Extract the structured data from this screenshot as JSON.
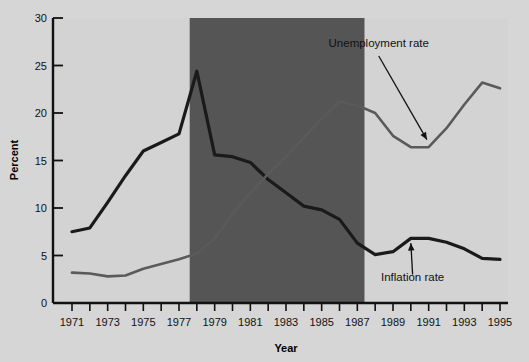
{
  "chart_data": {
    "type": "line",
    "title": "",
    "xlabel": "Year",
    "ylabel": "Percent",
    "xlim": [
      1971,
      1995
    ],
    "ylim": [
      0,
      30
    ],
    "yticks": [
      0,
      5,
      10,
      15,
      20,
      25,
      30
    ],
    "xticks": [
      1971,
      1972,
      1973,
      1974,
      1975,
      1976,
      1977,
      1978,
      1979,
      1980,
      1981,
      1982,
      1983,
      1984,
      1985,
      1986,
      1987,
      1988,
      1989,
      1990,
      1991,
      1992,
      1993,
      1994,
      1995
    ],
    "xtick_labels_shown": [
      "1971",
      "1973",
      "1975",
      "1977",
      "1979",
      "1981",
      "1983",
      "1985",
      "1987",
      "1989",
      "1991",
      "1993",
      "1995"
    ],
    "ytick_labels": [
      "0",
      "5",
      "10",
      "15",
      "20",
      "25",
      "30"
    ],
    "grid": false,
    "legend_position": "inline-annotations",
    "x": [
      1971,
      1972,
      1973,
      1974,
      1975,
      1976,
      1977,
      1978,
      1979,
      1980,
      1981,
      1982,
      1983,
      1984,
      1985,
      1986,
      1987,
      1988,
      1989,
      1990,
      1991,
      1992,
      1993,
      1994,
      1995
    ],
    "series": [
      {
        "name": "Inflation rate",
        "color": "#1a1a1a",
        "line_width": 3.2,
        "values": [
          7.5,
          7.9,
          10.6,
          13.4,
          16.0,
          16.9,
          17.8,
          24.4,
          15.6,
          15.4,
          14.8,
          13.0,
          11.6,
          10.2,
          9.8,
          8.8,
          6.3,
          5.1,
          5.4,
          6.8,
          6.8,
          6.4,
          5.7,
          4.7,
          4.6
        ]
      },
      {
        "name": "Unemployment rate",
        "color": "#5a5a5a",
        "line_width": 2.6,
        "values": [
          3.2,
          3.1,
          2.8,
          2.9,
          3.6,
          4.1,
          4.6,
          5.2,
          6.8,
          9.4,
          11.6,
          13.6,
          15.4,
          17.4,
          19.4,
          21.2,
          20.8,
          20.0,
          17.6,
          16.4,
          16.4,
          18.4,
          20.9,
          23.2,
          22.6
        ]
      }
    ],
    "annotations": [
      {
        "text": "Unemployment rate",
        "label_x": 1988.2,
        "label_y": 27.0,
        "arrow_from_x": 1988.2,
        "arrow_from_y": 26.0,
        "arrow_to_x": 1990.9,
        "arrow_to_y": 17.2
      },
      {
        "text": "Inflation rate",
        "label_x": 1990.1,
        "label_y": 2.3,
        "arrow_from_x": 1990.1,
        "arrow_from_y": 3.0,
        "arrow_to_x": 1990.0,
        "arrow_to_y": 6.3
      }
    ],
    "shaded_band": {
      "x_start": 1977.6,
      "x_end": 1987.4,
      "color": "#555555",
      "plot_background": "#d3d3d3"
    }
  }
}
